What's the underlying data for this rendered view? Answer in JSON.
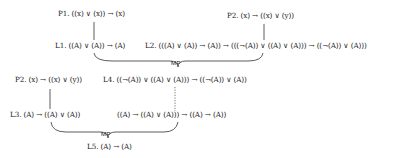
{
  "diagram": {
    "nodes": {
      "p1_top": "P1. ((x) ∨ (x)) → (x)",
      "p2_top": "P2. (x) → ((x) ∨ (y))",
      "l1": "L1. ((A) ∨ (A)) → (A)",
      "l2": "L2. (((A) ∨ (A)) → (A)) → (((¬(A)) ∨ ((A) ∨ (A))) → ((¬(A)) ∨ (A)))",
      "p2_mid": "P2. (x) → ((x) ∨ (y))",
      "l4": "L4. ((¬(A)) ∨ ((A) ∨ (A))) → ((¬(A)) ∨ (A))",
      "l3": "L3. (A) → ((A) ∨ (A))",
      "l4_equiv": "((A) → ((A) ∨ (A))) → ((A) → (A))",
      "l5": "L5. (A) → (A)"
    },
    "rules": {
      "mp_top": "MP",
      "mp_bottom": "MP"
    },
    "edges": [
      {
        "from": "p1_top",
        "to": "l1",
        "style": "solid"
      },
      {
        "from": "p2_top",
        "to": "l2",
        "style": "solid"
      },
      {
        "from": [
          "l1",
          "l2"
        ],
        "to": "l4",
        "style": "brace",
        "rule": "MP"
      },
      {
        "from": "p2_mid",
        "to": "l3",
        "style": "solid"
      },
      {
        "from": "l4",
        "to": "l4_equiv",
        "style": "dotted"
      },
      {
        "from": [
          "l3",
          "l4_equiv"
        ],
        "to": "l5",
        "style": "brace",
        "rule": "MP"
      }
    ]
  }
}
